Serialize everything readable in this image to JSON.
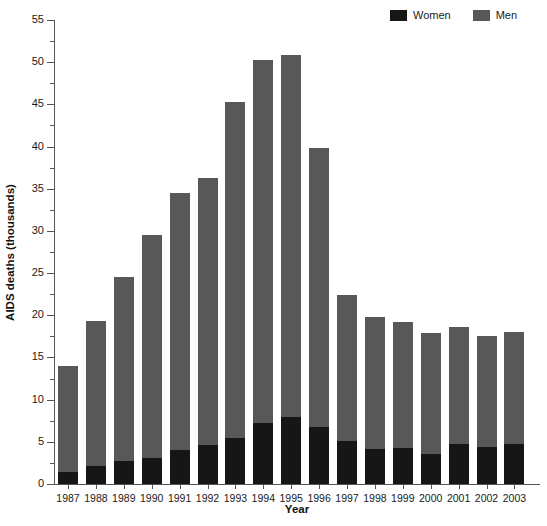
{
  "chart_data": {
    "type": "bar",
    "subtype": "stacked",
    "title": "",
    "xlabel": "Year",
    "ylabel": "AIDS deaths (thousands)",
    "categories": [
      "1987",
      "1988",
      "1989",
      "1990",
      "1991",
      "1992",
      "1993",
      "1994",
      "1995",
      "1996",
      "1997",
      "1998",
      "1999",
      "2000",
      "2001",
      "2002",
      "2003"
    ],
    "series": [
      {
        "name": "Women",
        "color": "#161616",
        "values": [
          1.4,
          2.1,
          2.7,
          3.1,
          4.0,
          4.6,
          5.5,
          7.2,
          7.9,
          6.8,
          5.1,
          4.1,
          4.3,
          3.5,
          4.7,
          4.4,
          4.8
        ]
      },
      {
        "name": "Men",
        "color": "#585858",
        "values": [
          12.6,
          17.2,
          21.8,
          26.4,
          30.5,
          31.7,
          39.8,
          43.1,
          42.9,
          33.0,
          17.3,
          15.7,
          14.9,
          14.4,
          13.9,
          13.2,
          13.2
        ]
      }
    ],
    "totals": [
      14.0,
      19.3,
      24.5,
      29.5,
      34.5,
      36.3,
      45.3,
      50.3,
      50.8,
      39.8,
      22.4,
      19.8,
      19.2,
      17.9,
      18.6,
      17.6,
      18.0
    ],
    "ylim": [
      0,
      55
    ],
    "yticks": [
      0,
      5,
      10,
      15,
      20,
      25,
      30,
      35,
      40,
      45,
      50,
      55
    ],
    "ytick_labels": [
      "0",
      "5",
      "10",
      "15",
      "20",
      "25",
      "30",
      "35",
      "40",
      "45",
      "50",
      "55"
    ],
    "yminor_ticks": [
      2.5,
      7.5,
      12.5,
      17.5,
      22.5,
      27.5,
      32.5,
      37.5,
      42.5,
      47.5,
      52.5
    ],
    "grid": false,
    "legend": {
      "position": "top-right",
      "entries": [
        {
          "label": "Women",
          "color": "#161616"
        },
        {
          "label": "Men",
          "color": "#585858"
        }
      ]
    }
  }
}
